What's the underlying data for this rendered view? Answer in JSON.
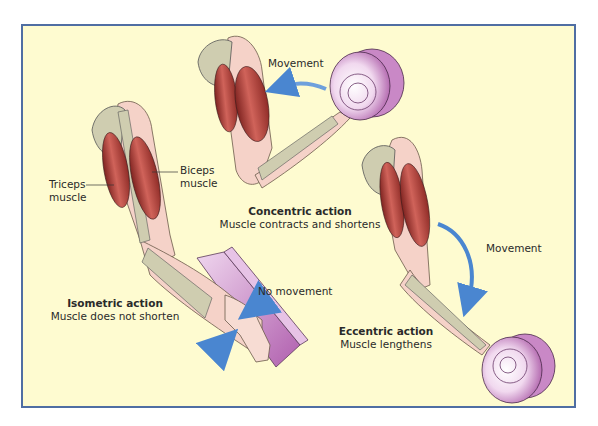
{
  "diagram": {
    "colors": {
      "background": "#fefbd0",
      "frame_border": "#4f6ea3",
      "muscle": "#b8433d",
      "bone": "#cfcdb0",
      "skin": "#f5d2c8",
      "weight_plate": "#d9a6d6",
      "arrow": "#4a86d0"
    },
    "labels": {
      "biceps": [
        "Biceps",
        "muscle"
      ],
      "triceps": [
        "Triceps",
        "muscle"
      ],
      "movement_top": "Movement",
      "movement_right": "Movement",
      "no_movement": "No movement"
    },
    "panels": [
      {
        "id": "concentric",
        "title": "Concentric action",
        "caption": "Muscle contracts and shortens"
      },
      {
        "id": "isometric",
        "title": "Isometric action",
        "caption": "Muscle does not shorten"
      },
      {
        "id": "eccentric",
        "title": "Eccentric action",
        "caption": "Muscle lengthens"
      }
    ]
  }
}
